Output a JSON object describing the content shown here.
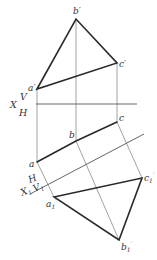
{
  "diagram": {
    "axes": {
      "x": {
        "label": "X",
        "upper": "V",
        "lower": "H"
      },
      "x1": {
        "label": "X",
        "label_sub": "1",
        "upper": "H",
        "lower": "V",
        "lower_sub": "1"
      }
    },
    "points": {
      "a_prime": {
        "label": "a",
        "mark": "′",
        "x": 37,
        "y": 89
      },
      "b_prime": {
        "label": "b",
        "mark": "′",
        "x": 76,
        "y": 19
      },
      "c_prime": {
        "label": "c",
        "mark": "′",
        "x": 117,
        "y": 63
      },
      "a": {
        "label": "a",
        "x": 37,
        "y": 162
      },
      "b": {
        "label": "b",
        "x": 76,
        "y": 141
      },
      "c": {
        "label": "c",
        "x": 117,
        "y": 122
      },
      "a1_prime": {
        "label": "a",
        "sub": "1",
        "mark": "′",
        "x": 54,
        "y": 197
      },
      "b1_prime": {
        "label": "b",
        "sub": "1",
        "mark": "′",
        "x": 119,
        "y": 240
      },
      "c1_prime": {
        "label": "c",
        "sub": "1",
        "mark": "′",
        "x": 142,
        "y": 178
      }
    },
    "colors": {
      "thick_line": "#2a2a2a",
      "thin_line": "#8a8a8a",
      "background": "#ffffff"
    }
  }
}
